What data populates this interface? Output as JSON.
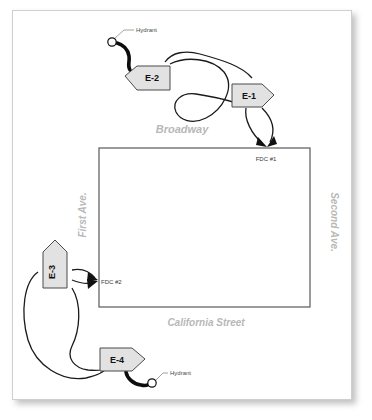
{
  "page": {
    "background_color": "#ffffff",
    "card_color": "#ffffff",
    "card_border_color": "#cfcfcf"
  },
  "building": {
    "name": "building-footprint",
    "outline_color": "#595959",
    "x": 99,
    "y": 148,
    "width": 211,
    "height": 159
  },
  "streets": [
    {
      "id": "broadway",
      "label": "Broadway",
      "x": 182,
      "y": 133,
      "rotation": 0,
      "color": "#b8b8b8",
      "font_size": 11
    },
    {
      "id": "california-street",
      "label": "California Street",
      "x": 206,
      "y": 326,
      "rotation": 0,
      "color": "#b8b8b8",
      "font_size": 10
    },
    {
      "id": "first-ave",
      "label": "First Ave.",
      "x": 86,
      "y": 215,
      "rotation": -90,
      "color": "#b8b8b8",
      "font_size": 10
    },
    {
      "id": "second-ave",
      "label": "Second Ave.",
      "x": 331,
      "y": 222,
      "rotation": 90,
      "color": "#b8b8b8",
      "font_size": 10
    }
  ],
  "apparatus": [
    {
      "id": "e-2",
      "label": "E-2",
      "direction": "left",
      "x": 145,
      "y": 76,
      "label_rotation": 0,
      "fill": "#e2e2e2",
      "stroke": "#4a4a4a"
    },
    {
      "id": "e-1",
      "label": "E-1",
      "direction": "right",
      "x": 252,
      "y": 95,
      "label_rotation": 0,
      "fill": "#e2e2e2",
      "stroke": "#4a4a4a"
    },
    {
      "id": "e-3",
      "label": "E-3",
      "direction": "up",
      "x": 55,
      "y": 268,
      "label_rotation": -90,
      "fill": "#e2e2e2",
      "stroke": "#4a4a4a"
    },
    {
      "id": "e-4",
      "label": "E-4",
      "direction": "right",
      "x": 122,
      "y": 359,
      "label_rotation": 0,
      "fill": "#e2e2e2",
      "stroke": "#4a4a4a"
    }
  ],
  "fdc_connections": [
    {
      "id": "fdc-1",
      "label": "FDC #1",
      "wall": "top",
      "label_x": 266,
      "label_y": 161,
      "point_x": 265,
      "point_y": 148
    },
    {
      "id": "fdc-2",
      "label": "FDC #2",
      "wall": "left",
      "label_x": 101,
      "label_y": 284,
      "point_x": 99,
      "point_y": 281
    }
  ],
  "hydrants": [
    {
      "id": "hydrant-north",
      "label": "Hydrant",
      "symbol_x": 112,
      "symbol_y": 42,
      "label_x": 136,
      "label_y": 30,
      "serves": "E-2"
    },
    {
      "id": "hydrant-south",
      "label": "Hydrant",
      "symbol_x": 152,
      "symbol_y": 383,
      "label_x": 170,
      "label_y": 371,
      "serves": "E-4"
    }
  ],
  "supply_lines": [
    {
      "id": "line-e2-to-e1-upper",
      "from": "E-2",
      "to": "E-1",
      "type": "supply"
    },
    {
      "id": "line-e2-to-e1-lower",
      "from": "E-2",
      "to": "E-1",
      "type": "supply"
    },
    {
      "id": "line-e1-to-fdc1-a",
      "from": "E-1",
      "to": "FDC #1",
      "type": "supply"
    },
    {
      "id": "line-e1-to-fdc1-b",
      "from": "E-1",
      "to": "FDC #1",
      "type": "supply"
    },
    {
      "id": "line-e3-to-fdc2-a",
      "from": "E-3",
      "to": "FDC #2",
      "type": "supply"
    },
    {
      "id": "line-e3-to-fdc2-b",
      "from": "E-3",
      "to": "FDC #2",
      "type": "supply"
    },
    {
      "id": "line-e4-to-e3-a",
      "from": "E-4",
      "to": "E-3",
      "type": "supply"
    },
    {
      "id": "line-e4-to-e3-b",
      "from": "E-4",
      "to": "E-3",
      "type": "supply"
    }
  ],
  "hydrant_hoses": [
    {
      "id": "hose-hydrant-north-e2",
      "from": "hydrant-north",
      "to": "E-2",
      "type": "large-diameter"
    },
    {
      "id": "hose-hydrant-south-e4",
      "from": "hydrant-south",
      "to": "E-4",
      "type": "large-diameter"
    }
  ]
}
